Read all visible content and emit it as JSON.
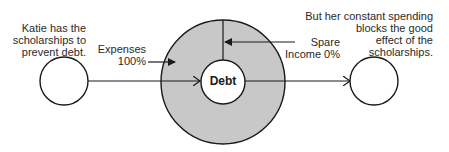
{
  "diagram": {
    "left_note": [
      "Katie has the",
      "scholarships to",
      "prevent debt."
    ],
    "right_note": [
      "But her constant spending",
      "blocks the good",
      "effect of the",
      "scholarships."
    ],
    "expenses_label": [
      "Expenses",
      "100%"
    ],
    "spare_label": [
      "Spare",
      "Income 0%"
    ],
    "center_label": "Debt",
    "colors": {
      "ring_fill": "#c8c8c8",
      "stroke": "#1a1a1a",
      "background": "#ffffff"
    }
  }
}
